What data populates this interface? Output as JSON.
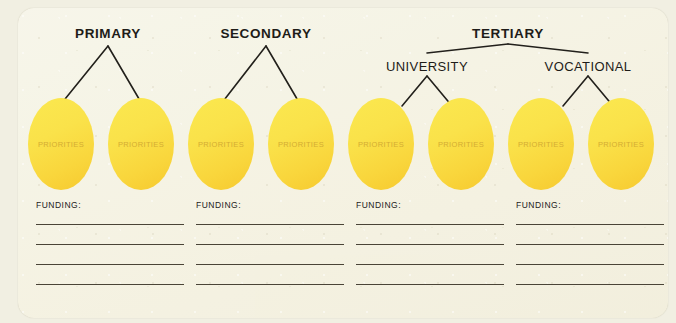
{
  "diagram": {
    "background_color": "#f1efe2",
    "card_color": "#f4f1e0",
    "accent_color": "#fae24a",
    "line_color": "#4a4437",
    "tiers": [
      {
        "label": "PRIMARY",
        "center_x": 108,
        "label_y": 26
      },
      {
        "label": "SECONDARY",
        "center_x": 266,
        "label_y": 26
      },
      {
        "label": "TERTIARY",
        "center_x": 508,
        "label_y": 26
      }
    ],
    "branches": [
      {
        "label": "UNIVERSITY",
        "center_x": 427,
        "label_y": 59
      },
      {
        "label": "VOCATIONAL",
        "center_x": 588,
        "label_y": 59
      }
    ],
    "ellipses": [
      {
        "label": "PRIORITIES",
        "x": 28,
        "y": 98
      },
      {
        "label": "PRIORITIES",
        "x": 108,
        "y": 98
      },
      {
        "label": "PRIORITIES",
        "x": 188,
        "y": 98
      },
      {
        "label": "PRIORITIES",
        "x": 268,
        "y": 98
      },
      {
        "label": "PRIORITIES",
        "x": 348,
        "y": 98
      },
      {
        "label": "PRIORITIES",
        "x": 428,
        "y": 98
      },
      {
        "label": "PRIORITIES",
        "x": 508,
        "y": 98
      },
      {
        "label": "PRIORITIES",
        "x": 588,
        "y": 98
      }
    ],
    "funding_blocks": [
      {
        "title": "FUNDING:",
        "x": 36,
        "y": 200,
        "lines": 4
      },
      {
        "title": "FUNDING:",
        "x": 196,
        "y": 200,
        "lines": 4
      },
      {
        "title": "FUNDING:",
        "x": 356,
        "y": 200,
        "lines": 4
      },
      {
        "title": "FUNDING:",
        "x": 516,
        "y": 200,
        "lines": 4
      }
    ],
    "connectors": [
      {
        "name": "primary-fork",
        "type": "fork",
        "apex_x": 108,
        "apex_y": 46,
        "left_x": 61,
        "right_x": 142,
        "leg_y": 104
      },
      {
        "name": "secondary-fork",
        "type": "fork",
        "apex_x": 266,
        "apex_y": 46,
        "left_x": 221,
        "right_x": 300,
        "leg_y": 104
      },
      {
        "name": "tertiary-fork",
        "type": "fork",
        "apex_x": 508,
        "apex_y": 44,
        "left_x": 427,
        "right_x": 588,
        "leg_y": 53
      },
      {
        "name": "university-fork",
        "type": "fork",
        "apex_x": 427,
        "apex_y": 76,
        "left_x": 402,
        "right_x": 452,
        "leg_y": 106
      },
      {
        "name": "vocational-fork",
        "type": "fork",
        "apex_x": 588,
        "apex_y": 76,
        "left_x": 563,
        "right_x": 613,
        "leg_y": 106
      }
    ]
  }
}
